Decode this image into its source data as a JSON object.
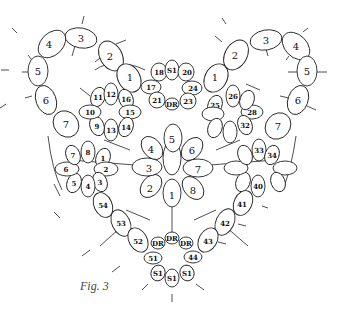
{
  "caption": "Fig. 3",
  "diagram": {
    "rings": [
      {
        "id": "L4",
        "label": "4",
        "x": 22,
        "y": 44,
        "rx": 11,
        "ry": 15,
        "rot": 45
      },
      {
        "id": "L3",
        "label": "3",
        "x": 58,
        "y": 38,
        "rx": 16,
        "ry": 9,
        "rot": 10
      },
      {
        "id": "L5",
        "label": "5",
        "x": 12,
        "y": 70,
        "rx": 10,
        "ry": 15,
        "rot": 0
      },
      {
        "id": "L2",
        "label": "2",
        "x": 76,
        "y": 56,
        "rx": 11,
        "ry": 15,
        "rot": -30
      },
      {
        "id": "L6",
        "label": "6",
        "x": 16,
        "y": 100,
        "rx": 10,
        "ry": 15,
        "rot": -20
      },
      {
        "id": "L1",
        "label": "1",
        "x": 87,
        "y": 78,
        "rx": 10,
        "ry": 15,
        "rot": -30
      },
      {
        "id": "L7",
        "label": "7",
        "x": 40,
        "y": 124,
        "rx": 12,
        "ry": 14,
        "rot": -40
      },
      {
        "id": "c18",
        "label": "18",
        "x": 100,
        "y": 72,
        "rx": 9,
        "ry": 9,
        "rot": 0,
        "small": true
      },
      {
        "id": "cS1t",
        "label": "S1",
        "x": 113,
        "y": 70,
        "rx": 8,
        "ry": 10,
        "rot": 0,
        "small": true
      },
      {
        "id": "c20",
        "label": "20",
        "x": 127,
        "y": 72,
        "rx": 9,
        "ry": 9,
        "rot": 0,
        "small": true
      },
      {
        "id": "c17",
        "label": "17",
        "x": 98,
        "y": 86,
        "rx": 10,
        "ry": 7,
        "rot": 0,
        "small": true
      },
      {
        "id": "c24",
        "label": "24",
        "x": 130,
        "y": 86,
        "rx": 10,
        "ry": 7,
        "rot": 0,
        "small": true
      },
      {
        "id": "c21",
        "label": "21",
        "x": 104,
        "y": 99,
        "rx": 8,
        "ry": 8,
        "rot": 0,
        "small": true
      },
      {
        "id": "cDRt",
        "label": "DR",
        "x": 114,
        "y": 104,
        "rx": 7,
        "ry": 6,
        "rot": 0,
        "small": true
      },
      {
        "id": "c23",
        "label": "23",
        "x": 126,
        "y": 100,
        "rx": 8,
        "ry": 8,
        "rot": 0,
        "small": true
      },
      {
        "id": "R1",
        "label": "1",
        "x": 165,
        "y": 78,
        "rx": 10,
        "ry": 15,
        "rot": 30
      },
      {
        "id": "R2",
        "label": "2",
        "x": 172,
        "y": 55,
        "rx": 11,
        "ry": 15,
        "rot": 30
      },
      {
        "id": "R3",
        "label": "3",
        "x": 266,
        "y": 40,
        "rx": 16,
        "ry": 9,
        "rot": -10
      },
      {
        "id": "R4",
        "label": "4",
        "x": 296,
        "y": 46,
        "rx": 11,
        "ry": 15,
        "rot": -45
      },
      {
        "id": "R5",
        "label": "5",
        "x": 307,
        "y": 70,
        "rx": 10,
        "ry": 15,
        "rot": 0
      },
      {
        "id": "R6",
        "label": "6",
        "x": 298,
        "y": 100,
        "rx": 10,
        "ry": 15,
        "rot": 20
      },
      {
        "id": "R7",
        "label": "7",
        "x": 278,
        "y": 126,
        "rx": 12,
        "ry": 14,
        "rot": 40
      }
    ],
    "left_flower": [
      "11",
      "12",
      "16",
      "15",
      "14",
      "13",
      "9",
      "10"
    ],
    "right_flower": [
      "25",
      "26",
      "28",
      "32"
    ],
    "center_flower": [
      "1",
      "2",
      "3",
      "4",
      "5",
      "6",
      "7",
      "8"
    ],
    "lower_left_flower": [
      "8",
      "1",
      "2",
      "3",
      "4",
      "5",
      "6",
      "7"
    ],
    "lower_right_flower": [
      "33",
      "34",
      "40"
    ],
    "left_arm": [
      "54",
      "53",
      "52",
      "51"
    ],
    "right_arm": [
      "41",
      "42",
      "43",
      "44"
    ],
    "bottom": [
      "DR",
      "DR",
      "DR",
      "S1",
      "S1",
      "S1"
    ]
  }
}
